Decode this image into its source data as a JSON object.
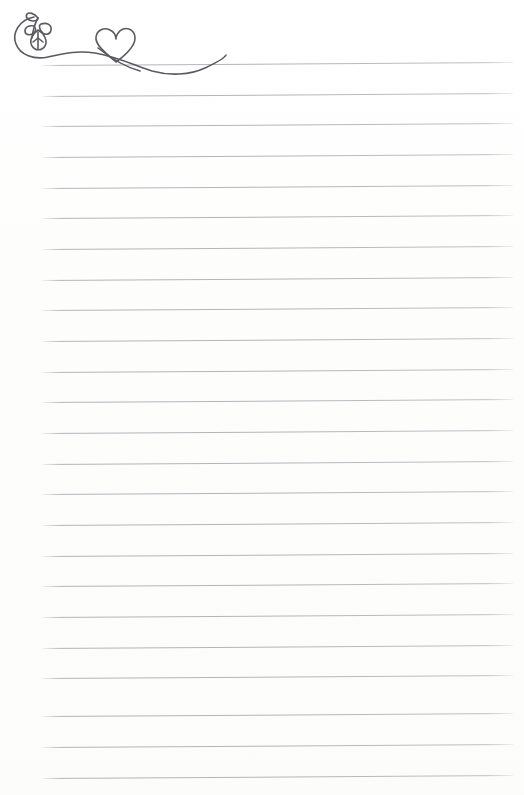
{
  "page": {
    "kind": "ruled-stationery-sheet",
    "title": "Lined Notepaper With Heart And Vine Flourish",
    "width": 524,
    "height": 795,
    "background_color": "#fefefe",
    "body_text": ""
  },
  "rules": {
    "count": 24,
    "line_color": "#acacb4",
    "line_thickness_px": 1,
    "first_line_y": 65,
    "spacing_px": 31,
    "left_x": 42,
    "right_x": 513,
    "slope_px": -3,
    "positions": [
      65,
      96,
      126,
      157,
      188,
      218,
      249,
      280,
      310,
      341,
      372,
      402,
      433,
      464,
      494,
      525,
      556,
      586,
      617,
      648,
      678,
      716,
      747,
      778
    ]
  },
  "flourish": {
    "name": "heart-and-vine-swash",
    "stroke_color": "#5a5a60",
    "stroke_width": 1.6,
    "description": "Hand drawn swash: a looping stem on the left bearing leaves and a small leaf pendant, sweeping right into an open heart and tapering off to the right.",
    "parts": {
      "loop": "left-stem-loop",
      "sprig": "leaf-sprig",
      "pendant": "leaf-pendant",
      "heart": "heart-outline",
      "tail": "tapering-tail"
    }
  }
}
